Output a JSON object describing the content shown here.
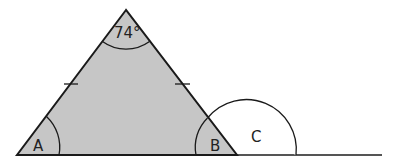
{
  "diagram": {
    "type": "isosceles triangle with exterior angle",
    "labels": {
      "apex_angle": "74°",
      "angle_a": "A",
      "angle_b": "B",
      "exterior_angle_c": "C"
    },
    "colors": {
      "fill": "#c6c6c6",
      "stroke": "#1a1a1a",
      "baseline": "#555555"
    },
    "features": {
      "equal_side_ticks": 2,
      "base_extended_right": true
    }
  }
}
